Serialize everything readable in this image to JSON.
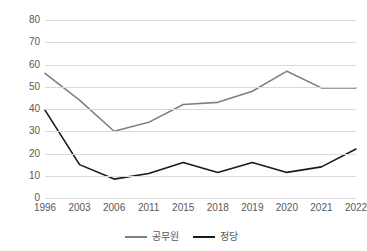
{
  "chart_data": {
    "type": "line",
    "title": "",
    "subtitle": "",
    "xlabel": "",
    "ylabel": "",
    "categories": [
      "1996",
      "2003",
      "2006",
      "2011",
      "2015",
      "2018",
      "2019",
      "2020",
      "2021",
      "2022"
    ],
    "series": [
      {
        "name": "공무원",
        "color": "#808080",
        "values": [
          56,
          44,
          30,
          34,
          42,
          43,
          48,
          57,
          49.5,
          49.5
        ]
      },
      {
        "name": "정당",
        "color": "#1a1a1a",
        "values": [
          39.5,
          15,
          8.5,
          11,
          16,
          11.5,
          16,
          11.5,
          14,
          22
        ]
      }
    ],
    "ylim": [
      0,
      80
    ],
    "yticks": [
      0,
      10,
      20,
      30,
      40,
      50,
      60,
      70,
      80
    ],
    "ytick_labels": [
      "0",
      "10",
      "20",
      "30",
      "40",
      "50",
      "60",
      "70",
      "80"
    ],
    "grid": true,
    "grid_axis": "y",
    "grid_color": "#d9d9d9",
    "legend_position": "bottom",
    "legend": [
      "공무원",
      "정당"
    ],
    "background": "#ffffff",
    "tick_label_color": "#595959"
  }
}
